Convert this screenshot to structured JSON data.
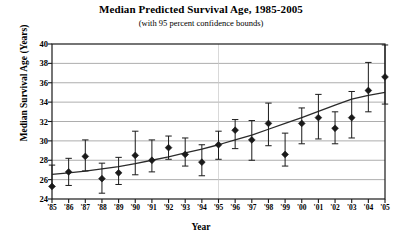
{
  "chart_data": {
    "type": "scatter",
    "title": "Median Predicted Survival Age, 1985-2005",
    "subtitle": "(with 95 percent confidence bounds)",
    "xlabel": "Year",
    "ylabel": "Median Survival Age (Years)",
    "xlim": [
      1985,
      2005
    ],
    "ylim": [
      24,
      40
    ],
    "yticks": [
      24,
      26,
      28,
      30,
      32,
      34,
      36,
      38,
      40
    ],
    "grid": true,
    "legend": null,
    "categories": [
      "'85",
      "'86",
      "'87",
      "'88",
      "'89",
      "'90",
      "'91",
      "'92",
      "'93",
      "'94",
      "'95",
      "'96",
      "'97",
      "'98",
      "'99",
      "'00",
      "'01",
      "'02",
      "'03",
      "'04",
      "'05"
    ],
    "x": [
      1985,
      1986,
      1987,
      1988,
      1989,
      1990,
      1991,
      1992,
      1993,
      1994,
      1995,
      1996,
      1997,
      1998,
      1999,
      2000,
      2001,
      2002,
      2003,
      2004,
      2005
    ],
    "series": [
      {
        "name": "Median predicted survival age",
        "marker": "filled-diamond",
        "color": "#1a1a1a",
        "values": [
          25.3,
          26.8,
          28.4,
          26.1,
          26.7,
          28.5,
          28.0,
          29.3,
          28.6,
          27.8,
          29.6,
          31.1,
          30.1,
          31.8,
          28.6,
          31.8,
          32.4,
          31.3,
          32.4,
          35.2,
          36.6
        ],
        "ci_lower": [
          25.3,
          25.4,
          26.9,
          24.6,
          25.5,
          26.5,
          26.8,
          28.1,
          27.4,
          26.4,
          28.1,
          29.2,
          28.0,
          29.5,
          27.4,
          29.7,
          30.2,
          29.7,
          30.3,
          33.0,
          33.8
        ],
        "ci_upper": [
          27.5,
          28.2,
          30.1,
          27.7,
          28.3,
          31.0,
          30.1,
          30.5,
          30.3,
          29.6,
          31.0,
          32.2,
          32.1,
          33.9,
          30.8,
          33.4,
          34.8,
          33.0,
          35.1,
          38.1,
          39.9
        ]
      },
      {
        "name": "Fitted trend line",
        "marker": "none",
        "color": "#2b2b2b",
        "values": [
          26.55,
          26.7,
          26.88,
          27.1,
          27.35,
          27.65,
          28.0,
          28.35,
          28.75,
          29.15,
          29.6,
          30.1,
          30.6,
          31.2,
          31.8,
          32.4,
          33.05,
          33.7,
          34.3,
          34.7,
          35.0
        ]
      }
    ]
  }
}
